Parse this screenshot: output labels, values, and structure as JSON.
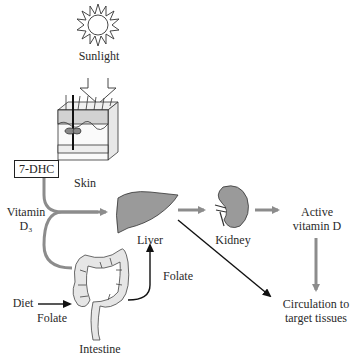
{
  "diagram": {
    "nodes": {
      "sunlight": {
        "label": "Sunlight",
        "icon": "sun-icon"
      },
      "skin": {
        "label": "Skin",
        "icon": "skin-section-icon"
      },
      "dhc": {
        "label": "7-DHC"
      },
      "vitamin_d3": {
        "line1": "Vitamin",
        "line2": "D₃"
      },
      "liver": {
        "label": "Liver",
        "icon": "liver-icon"
      },
      "kidney": {
        "label": "Kidney",
        "icon": "kidney-icon"
      },
      "active_vitd": {
        "line1": "Active",
        "line2": "vitamin D"
      },
      "circulation": {
        "line1": "Circulation to",
        "line2": "target tissues"
      },
      "intestine": {
        "label": "Intestine",
        "icon": "intestine-icon"
      },
      "diet": {
        "label": "Diet"
      },
      "folate_in": {
        "label": "Folate"
      },
      "folate_out": {
        "label": "Folate"
      }
    },
    "colors": {
      "gray_arrow": "#8c8c8c",
      "black_arrow": "#111111",
      "organ_fill": "#9a9a9a",
      "intestine_fill": "#e6e6e6"
    }
  }
}
